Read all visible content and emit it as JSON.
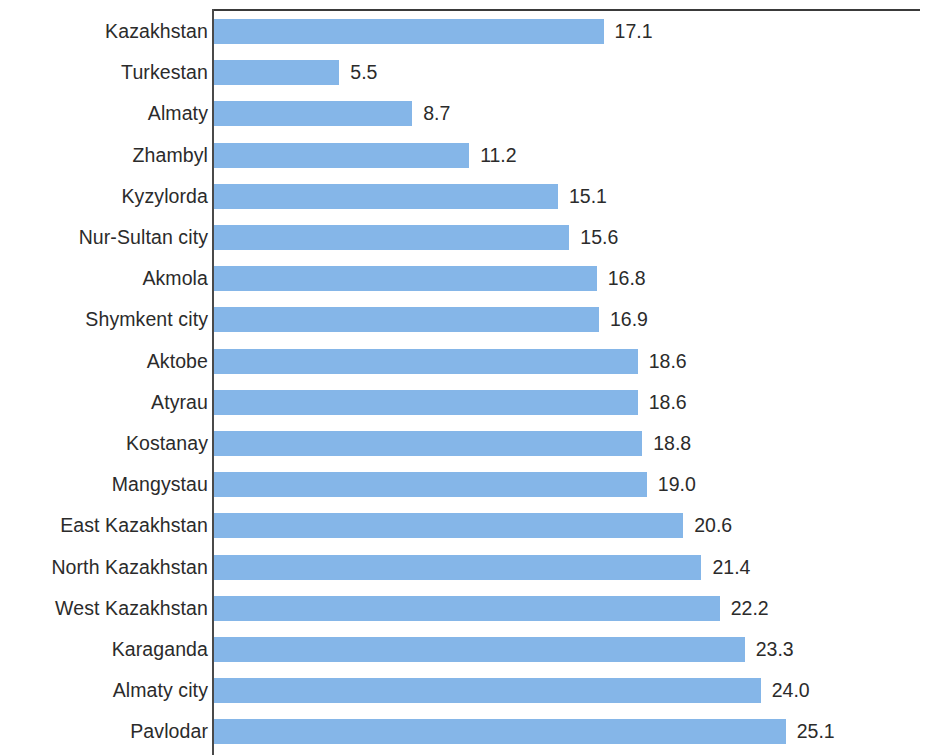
{
  "chart_data": {
    "type": "bar",
    "orientation": "horizontal",
    "title": "",
    "subtitle": "",
    "xlabel": "",
    "ylabel": "",
    "grid": false,
    "legend": null,
    "xlim": [
      0,
      31.4
    ],
    "axis_position": "left",
    "categories": [
      "Kazakhstan",
      "Turkestan",
      "Almaty",
      "Zhambyl",
      "Kyzylorda",
      "Nur-Sultan city",
      "Akmola",
      "Shymkent city",
      "Aktobe",
      "Atyrau",
      "Kostanay",
      "Mangystau",
      "East Kazakhstan",
      "North Kazakhstan",
      "West Kazakhstan",
      "Karaganda",
      "Almaty city",
      "Pavlodar"
    ],
    "values": [
      17.1,
      5.5,
      8.7,
      11.2,
      15.1,
      15.6,
      16.8,
      16.9,
      18.6,
      18.6,
      18.8,
      19.0,
      20.6,
      21.4,
      22.2,
      23.3,
      24.0,
      25.1
    ],
    "value_labels": [
      "17.1",
      "5.5",
      "8.7",
      "11.2",
      "15.1",
      "15.6",
      "16.8",
      "16.9",
      "18.6",
      "18.6",
      "18.8",
      "19.0",
      "20.6",
      "21.4",
      "22.2",
      "23.3",
      "24.0",
      "25.1"
    ],
    "colors": {
      "bar": "#85b6e8",
      "axis": "#4a4a4a",
      "frame": "#3a3a3a",
      "text": "#2b2b2b",
      "background": "#ffffff"
    }
  }
}
